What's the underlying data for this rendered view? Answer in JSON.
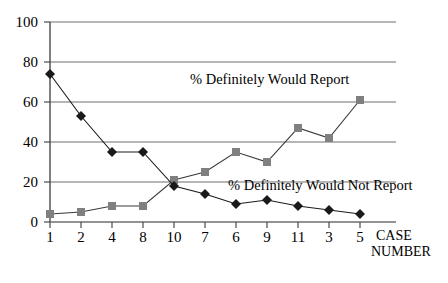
{
  "chart_data": {
    "type": "line",
    "title": "",
    "subtitle": "",
    "xlabel": "CASE NUMBER",
    "ylabel": "",
    "categories": [
      "1",
      "2",
      "4",
      "8",
      "10",
      "7",
      "6",
      "9",
      "11",
      "3",
      "5"
    ],
    "ylim": [
      0,
      100
    ],
    "yticks": [
      0,
      20,
      40,
      60,
      80,
      100
    ],
    "grid": "horizontal",
    "legend_position": "inline-annotation",
    "series": [
      {
        "name": "% Definitely Would Report",
        "marker": "square",
        "color": "#808080",
        "values": [
          4,
          5,
          8,
          8,
          21,
          25,
          35,
          30,
          47,
          42,
          61
        ]
      },
      {
        "name": "% Definitely Would Not Report",
        "marker": "diamond",
        "color": "#1a1a1a",
        "values": [
          74,
          53,
          35,
          35,
          18,
          14,
          9,
          11,
          8,
          6,
          4
        ]
      }
    ],
    "annotations": [
      {
        "text": "% Definitely Would Report",
        "x": 190,
        "y": 72
      },
      {
        "text": "% Definitely Would Not Report",
        "x": 228,
        "y": 178
      }
    ]
  },
  "axis": {
    "x_title_line1": "CASE",
    "x_title_line2": "NUMBER"
  },
  "colors": {
    "series_report": "#808080",
    "series_not_report": "#1a1a1a",
    "gridline": "#808080",
    "axis": "#555555",
    "background": "#ffffff"
  }
}
